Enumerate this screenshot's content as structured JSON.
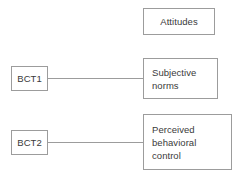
{
  "diagram": {
    "background_color": "#ffffff",
    "border_color": "#9c9c9c",
    "text_color": "#3a3a3a",
    "nodes": [
      {
        "id": "attitudes",
        "label": "Attitudes",
        "align": "center"
      },
      {
        "id": "subjective_norms",
        "label": "Subjective\nnorms",
        "align": "left"
      },
      {
        "id": "perceived_behavioral_control",
        "label": "Perceived\nbehavioral\ncontrol",
        "align": "left"
      },
      {
        "id": "bct1",
        "label": "BCT1",
        "align": "center"
      },
      {
        "id": "bct2",
        "label": "BCT2",
        "align": "center"
      }
    ],
    "edges": [
      {
        "id": "bct1_subjective_norms",
        "from": "bct1",
        "to": "subjective_norms"
      },
      {
        "id": "bct2_perceived_behavioral_control",
        "from": "bct2",
        "to": "perceived_behavioral_control"
      }
    ]
  }
}
